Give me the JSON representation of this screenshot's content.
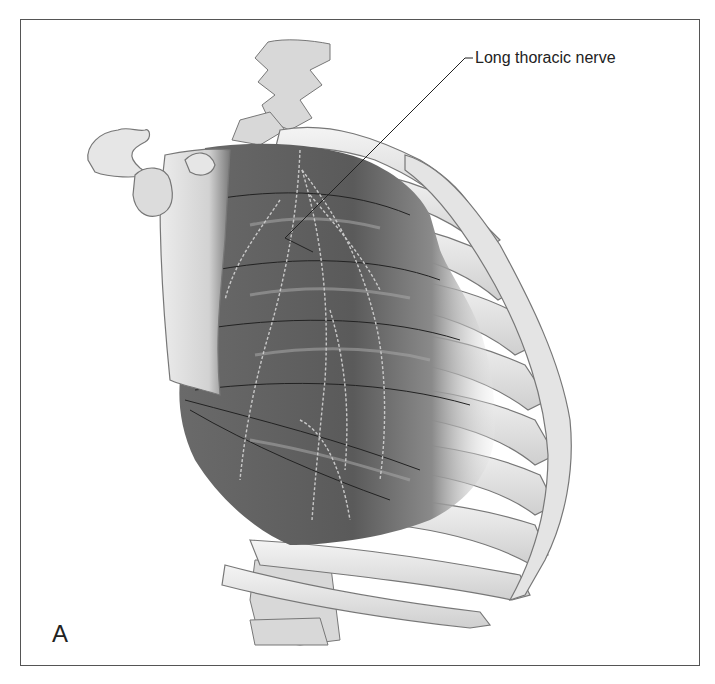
{
  "figure": {
    "panel_letter": "A",
    "labels": [
      {
        "text": "Long thoracic nerve",
        "target": "long-thoracic-nerve"
      }
    ]
  },
  "colors": {
    "frame": "#555555",
    "bone_fill": "#e6e6e6",
    "bone_outline": "#777777",
    "muscle_dark": "#5e5e5e",
    "muscle_light": "#9a9a9a",
    "nerve": "#c8c8c8",
    "leader_line": "#222222"
  }
}
